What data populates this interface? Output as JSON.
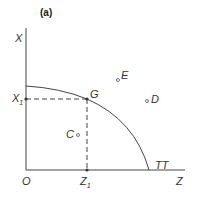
{
  "title": "(a)",
  "axes": {
    "y_label": "X",
    "x_label": "Z",
    "origin": "O"
  },
  "curve_label": "TT",
  "points": {
    "G": "G",
    "C": "C",
    "D": "D",
    "E": "E"
  },
  "ticks": {
    "x1": "X",
    "x1_sub": "1",
    "z1": "Z",
    "z1_sub": "1"
  },
  "colors": {
    "line": "#444444",
    "text": "#333333"
  }
}
